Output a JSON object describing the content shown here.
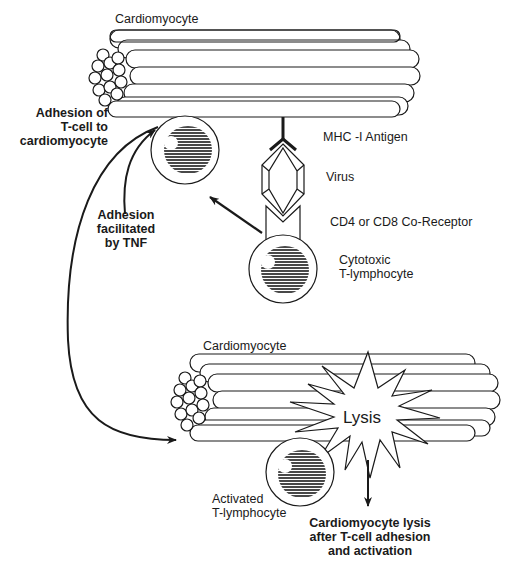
{
  "diagram": {
    "colors": {
      "ink": "#1a1a1a",
      "background": "#ffffff"
    },
    "top_panel": {
      "cell_label": "Cardiomyocyte",
      "adhesion_label": [
        "Adhesion of",
        "T-cell to",
        "cardiomyocyte"
      ],
      "tnf_label": [
        "Adhesion",
        "facilitated",
        "by TNF"
      ],
      "mhc_label": "MHC -I Antigen",
      "virus_label": "Virus",
      "coreceptor_label": "CD4 or CD8 Co-Receptor",
      "ctl_label": [
        "Cytotoxic",
        "T-lymphocyte"
      ]
    },
    "bottom_panel": {
      "cell_label": "Cardiomyocyte",
      "lysis_label": "Lysis",
      "activated_label": [
        "Activated",
        "T-lymphocyte"
      ],
      "outcome_label": [
        "Cardiomyocyte lysis",
        "after T-cell adhesion",
        "and activation"
      ]
    }
  }
}
